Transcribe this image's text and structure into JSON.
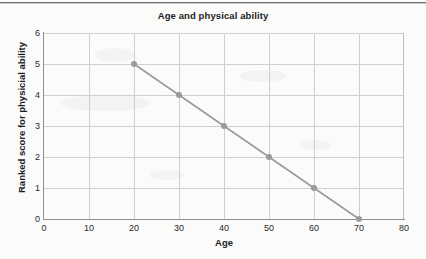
{
  "chart_data": {
    "type": "line",
    "title": "Age and physical ability",
    "xlabel": "Age",
    "ylabel": "Ranked score for physicial ability",
    "x": [
      20,
      30,
      40,
      50,
      60,
      70
    ],
    "values": [
      5,
      4,
      3,
      2,
      1,
      0
    ],
    "series": [
      {
        "name": "Ranked score for physicial ability",
        "points": [
          {
            "x": 20,
            "y": 5
          },
          {
            "x": 30,
            "y": 4
          },
          {
            "x": 40,
            "y": 3
          },
          {
            "x": 50,
            "y": 2
          },
          {
            "x": 60,
            "y": 1
          },
          {
            "x": 70,
            "y": 0
          }
        ]
      }
    ],
    "xlim": [
      0,
      80
    ],
    "ylim": [
      0,
      6
    ],
    "xticks": [
      0,
      10,
      20,
      30,
      40,
      50,
      60,
      70,
      80
    ],
    "yticks": [
      0,
      1,
      2,
      3,
      4,
      5,
      6
    ],
    "xtick_labels": [
      "0",
      "10",
      "20",
      "30",
      "40",
      "50",
      "60",
      "70",
      "80"
    ],
    "ytick_labels": [
      "0",
      "1",
      "2",
      "3",
      "4",
      "5",
      "6"
    ],
    "grid": true,
    "legend": false,
    "line_color": "#9a9a9a",
    "marker_color": "#9a9a9a",
    "grid_color": "#cfcfcf",
    "axis_color": "#8f8f8f",
    "text_color": "#1d1d1f",
    "background": "#fbfbfa"
  }
}
